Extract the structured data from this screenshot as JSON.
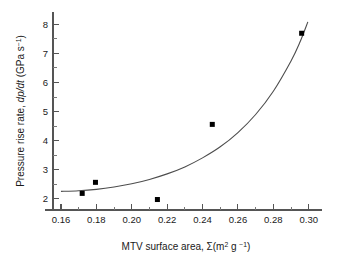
{
  "chart_data": {
    "type": "scatter",
    "title": "",
    "xlabel": "MTV surface area,  Σ(m² g⁻¹)",
    "ylabel": "Pressure rise rate, dp/dt (GPa s⁻¹)",
    "xlabel_parts": {
      "lead": "MTV surface area,  ",
      "sigma": "Σ",
      "open": "(m",
      "sup_m": "2",
      "mid": " g ",
      "sup_g": "−1",
      "close": ")"
    },
    "ylabel_parts": {
      "lead": "Pressure rise rate, ",
      "d1": "d",
      "p": "p",
      "d2": "/d",
      "t": "t",
      "unit_open": " (GPa s",
      "unit_sup": "−1",
      "unit_close": ")"
    },
    "xlim": [
      0.1555,
      0.3075
    ],
    "ylim": [
      1.62,
      8.42
    ],
    "x_major_ticks": [
      0.16,
      0.18,
      0.2,
      0.22,
      0.24,
      0.26,
      0.28,
      0.3
    ],
    "x_major_tick_labels": [
      "0.16",
      "0.18",
      "0.20",
      "0.22",
      "0.24",
      "0.26",
      "0.28",
      "0.30"
    ],
    "x_minor_ticks": [
      0.17,
      0.19,
      0.21,
      0.23,
      0.25,
      0.27,
      0.29
    ],
    "y_major_ticks": [
      2,
      3,
      4,
      5,
      6,
      7,
      8
    ],
    "y_major_tick_labels": [
      "2",
      "3",
      "4",
      "5",
      "6",
      "7",
      "8"
    ],
    "y_minor_ticks": [
      2.5,
      3.5,
      4.5,
      5.5,
      6.5,
      7.5
    ],
    "grid": false,
    "legend": null,
    "spines": [
      "left",
      "bottom"
    ],
    "marker": {
      "shape": "square",
      "color": "#000000",
      "size_px": 5
    },
    "points": [
      {
        "x": 0.172,
        "y": 2.19
      },
      {
        "x": 0.1795,
        "y": 2.57
      },
      {
        "x": 0.2145,
        "y": 1.98
      },
      {
        "x": 0.2455,
        "y": 4.56
      },
      {
        "x": 0.296,
        "y": 7.69
      }
    ],
    "fit_curve": {
      "kind": "exponential",
      "color": "#4d4d4d",
      "x_start": 0.16,
      "x_end": 0.2995,
      "points": [
        {
          "x": 0.16,
          "y": 2.26
        },
        {
          "x": 0.17,
          "y": 2.28
        },
        {
          "x": 0.18,
          "y": 2.33
        },
        {
          "x": 0.19,
          "y": 2.41
        },
        {
          "x": 0.2,
          "y": 2.52
        },
        {
          "x": 0.21,
          "y": 2.67
        },
        {
          "x": 0.22,
          "y": 2.86
        },
        {
          "x": 0.23,
          "y": 3.1
        },
        {
          "x": 0.24,
          "y": 3.41
        },
        {
          "x": 0.25,
          "y": 3.79
        },
        {
          "x": 0.26,
          "y": 4.28
        },
        {
          "x": 0.27,
          "y": 4.9
        },
        {
          "x": 0.28,
          "y": 5.7
        },
        {
          "x": 0.29,
          "y": 6.74
        },
        {
          "x": 0.295,
          "y": 7.38
        },
        {
          "x": 0.2995,
          "y": 8.08
        }
      ]
    }
  }
}
